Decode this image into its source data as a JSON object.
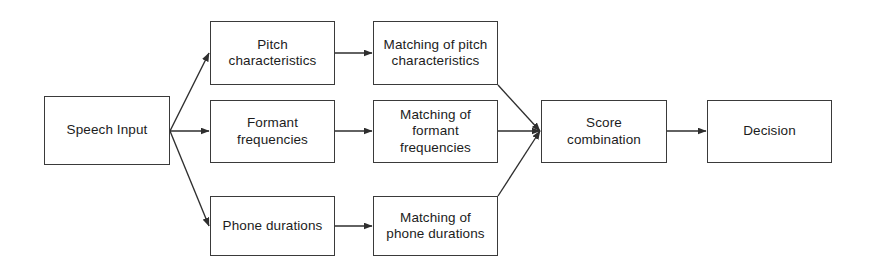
{
  "diagram": {
    "type": "flowchart",
    "orientation": "left-to-right",
    "background_color": "#ffffff",
    "line_color": "#3a3a3a",
    "text_color": "#1c1c1c",
    "nodes": [
      {
        "id": "speech_input",
        "label": "Speech Input"
      },
      {
        "id": "pitch",
        "label": "Pitch\ncharacteristics"
      },
      {
        "id": "formant",
        "label": "Formant\nfrequencies"
      },
      {
        "id": "phone",
        "label": "Phone durations"
      },
      {
        "id": "match_pitch",
        "label": "Matching of pitch\ncharacteristics"
      },
      {
        "id": "match_formant",
        "label": "Matching of\nformant\nfrequencies"
      },
      {
        "id": "match_phone",
        "label": "Matching of\nphone durations"
      },
      {
        "id": "score",
        "label": "Score\ncombination"
      },
      {
        "id": "decision",
        "label": "Decision"
      }
    ],
    "edges": [
      {
        "from": "speech_input",
        "to": "pitch",
        "style": "diagonal-up"
      },
      {
        "from": "speech_input",
        "to": "formant",
        "style": "straight"
      },
      {
        "from": "speech_input",
        "to": "phone",
        "style": "diagonal-down"
      },
      {
        "from": "pitch",
        "to": "match_pitch",
        "style": "straight"
      },
      {
        "from": "formant",
        "to": "match_formant",
        "style": "straight"
      },
      {
        "from": "phone",
        "to": "match_phone",
        "style": "straight"
      },
      {
        "from": "match_pitch",
        "to": "score",
        "style": "diagonal-down"
      },
      {
        "from": "match_formant",
        "to": "score",
        "style": "straight"
      },
      {
        "from": "match_phone",
        "to": "score",
        "style": "diagonal-up"
      },
      {
        "from": "score",
        "to": "decision",
        "style": "straight"
      }
    ]
  }
}
